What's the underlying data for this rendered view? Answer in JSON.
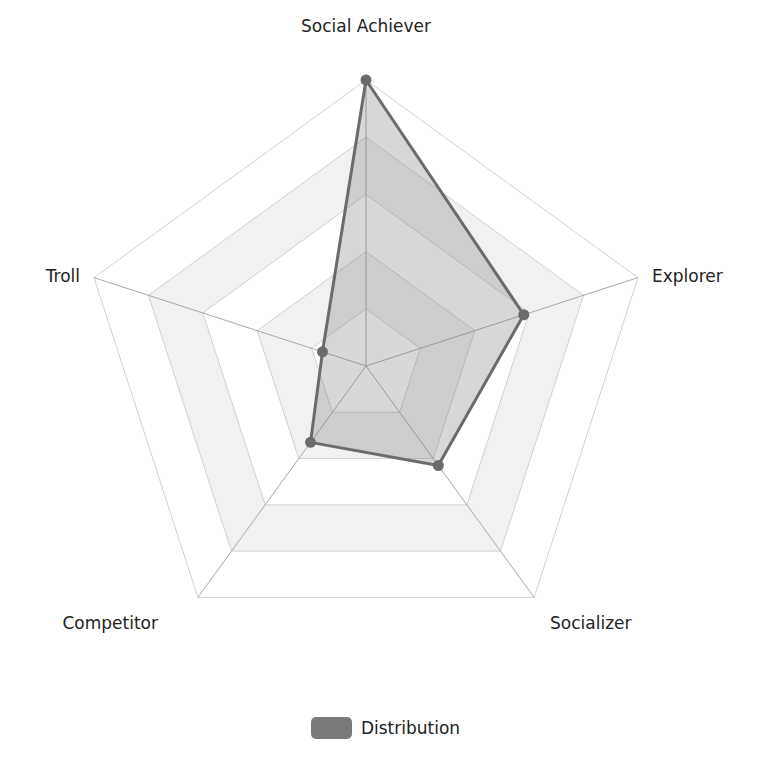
{
  "chart_data": {
    "type": "radar",
    "title": "",
    "axes": [
      "Social Achiever",
      "Explorer",
      "Socializer",
      "Competitor",
      "Troll"
    ],
    "series": [
      {
        "name": "Distribution",
        "values": [
          1.0,
          0.58,
          0.43,
          0.33,
          0.16
        ]
      }
    ],
    "range": [
      0,
      1
    ],
    "rings": 5,
    "grid": true,
    "legend_position": "bottom"
  },
  "style": {
    "series_stroke": "#6b6b6b",
    "series_fill": "rgba(110,110,110,0.28)",
    "point_color": "#6b6b6b",
    "grid_line": "#d0d0d0",
    "band_fill": "#f1f1f1"
  },
  "legend": {
    "label": "Distribution",
    "swatch_color": "#7a7a7a"
  }
}
